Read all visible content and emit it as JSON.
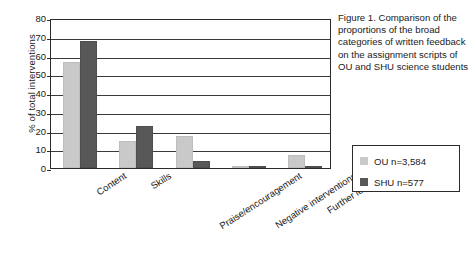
{
  "chart_data": {
    "type": "bar",
    "title": "",
    "xlabel": "",
    "ylabel": "% of total interventions",
    "ylim": [
      0,
      80
    ],
    "yticks": [
      0,
      10,
      20,
      30,
      40,
      50,
      60,
      70,
      80
    ],
    "grid": true,
    "legend_position": "right",
    "categories": [
      "Content",
      "Skills",
      "Praise/encouragement",
      "Negative interventions",
      "Further learning"
    ],
    "series": [
      {
        "name": "OU n=3,584",
        "color": "#c9c9c9",
        "values": [
          56.5,
          14.5,
          17,
          1,
          7
        ]
      },
      {
        "name": "SHU n=577",
        "color": "#585858",
        "values": [
          68,
          22.5,
          4,
          1,
          1
        ]
      }
    ]
  },
  "caption": {
    "text": "Figure 1. Comparison of the proportions of the broad categories of written feedback on the assignment scripts of OU and SHU science students"
  },
  "legend": {
    "items": [
      {
        "label": "OU n=3,584"
      },
      {
        "label": "SHU n=577"
      }
    ]
  }
}
